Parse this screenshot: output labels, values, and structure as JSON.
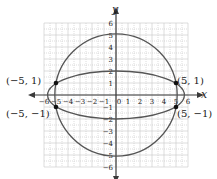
{
  "chart_data": {
    "type": "line",
    "title": "",
    "xlabel": "x",
    "ylabel": "y",
    "xlim": [
      -6,
      6
    ],
    "ylim": [
      -6,
      6
    ],
    "grid": true,
    "x_ticks": [
      -6,
      -5,
      -4,
      -3,
      -2,
      -1,
      0,
      1,
      2,
      3,
      4,
      5,
      6
    ],
    "y_ticks": [
      -6,
      -5,
      -4,
      -3,
      -2,
      -1,
      1,
      2,
      3,
      4,
      5,
      6
    ],
    "series": [
      {
        "name": "circle",
        "equation": "x^2 + y^2 = 26",
        "shape": "circle",
        "cx": 0,
        "cy": 0,
        "r": 5.099
      },
      {
        "name": "ellipse",
        "equation": "x^2/32.5 + y^2/4 = 1",
        "shape": "ellipse",
        "cx": 0,
        "cy": 0,
        "rx": 5.7,
        "ry": 2
      }
    ],
    "points": [
      {
        "x": -5,
        "y": 1,
        "label": "(−5, 1)"
      },
      {
        "x": 5,
        "y": 1,
        "label": "(5, 1)"
      },
      {
        "x": -5,
        "y": -1,
        "label": "(−5, −1)"
      },
      {
        "x": 5,
        "y": -1,
        "label": "(5, −1)"
      }
    ]
  },
  "labels": {
    "x_axis": "x",
    "y_axis": "y",
    "p1": "(−5, 1)",
    "p2": "(5, 1)",
    "p3": "(−5, −1)",
    "p4": "(5, −1)"
  },
  "colors": {
    "grid": "#c8c8c8",
    "axis": "#3a3a3a",
    "curve": "#555555",
    "point": "#111111"
  }
}
